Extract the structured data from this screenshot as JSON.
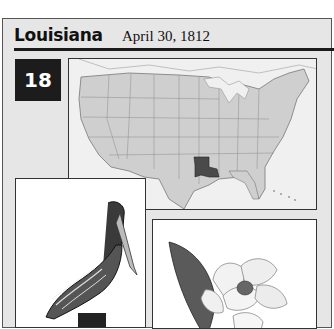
{
  "header": {
    "state_name": "Louisiana",
    "statehood_date": "April 30, 1812"
  },
  "badge": {
    "order_number": "18"
  },
  "map": {
    "description": "Map of the contiguous United States with Louisiana highlighted",
    "highlight_color": "#4a4a4a",
    "state_fill": "#cfcfcf",
    "water_fill": "#f0f0f0"
  },
  "illustrations": {
    "bird": "Brown pelican",
    "flower": "Magnolia"
  },
  "colors": {
    "card_background": "#e6e6e6",
    "badge_background": "#1c1c1c",
    "rule": "#1a1a1a"
  }
}
